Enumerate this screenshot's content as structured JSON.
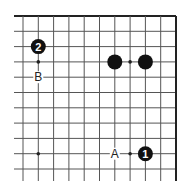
{
  "diagram": {
    "type": "go-board-corner",
    "grid": {
      "origin_x": 23,
      "origin_y": 16,
      "spacing": 15.3,
      "cols": 11,
      "rows": 11,
      "left_extend": 9,
      "bottom_extend": 12,
      "edges": [
        "top",
        "right"
      ]
    },
    "hoshi": [
      {
        "c": 1,
        "r": 3
      },
      {
        "c": 7,
        "r": 3
      },
      {
        "c": 1,
        "r": 9
      },
      {
        "c": 7,
        "r": 9
      }
    ],
    "stones": [
      {
        "c": 1,
        "r": 2,
        "color": "black",
        "label": "2"
      },
      {
        "c": 6,
        "r": 3,
        "color": "black",
        "label": ""
      },
      {
        "c": 8,
        "r": 3,
        "color": "black",
        "label": ""
      },
      {
        "c": 8,
        "r": 9,
        "color": "black",
        "label": "1"
      }
    ],
    "marks": [
      {
        "c": 1,
        "r": 4,
        "label": "B"
      },
      {
        "c": 6,
        "r": 9,
        "label": "A"
      }
    ],
    "colors": {
      "line": "#555555",
      "edge": "#222222",
      "stone": "#111111",
      "stone_text": "#ffffff",
      "label": "#222222"
    }
  }
}
